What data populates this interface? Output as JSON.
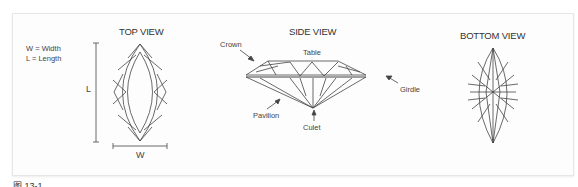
{
  "legend": {
    "width_def": "W = Width",
    "length_def": "L = Length"
  },
  "views": {
    "top": {
      "title": "TOP VIEW",
      "length_label": "L",
      "width_label": "W"
    },
    "side": {
      "title": "SIDE VIEW",
      "labels": {
        "crown": "Crown",
        "table": "Table",
        "girdle": "Girdle",
        "pavilion": "Pavilion",
        "culet": "Culet"
      }
    },
    "bottom": {
      "title": "BOTTOM VIEW"
    }
  },
  "caption": "图 13-1"
}
